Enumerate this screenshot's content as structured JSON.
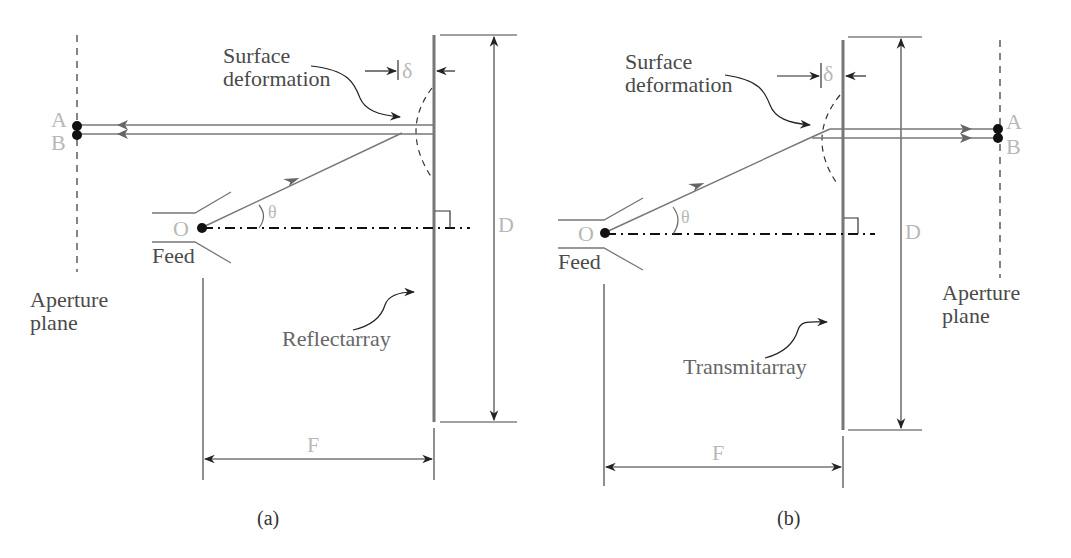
{
  "figure": {
    "colors": {
      "line": "#555555",
      "surface": "#777777",
      "light_label": "#b8b8b8",
      "dark_label": "#4a4a4a",
      "dot": "#111111"
    },
    "panels": [
      {
        "id": "a",
        "caption": "(a)",
        "array_label": "Reflectarray",
        "deformation_label": "Surface\ndeformation",
        "delta_label": "δ",
        "aperture_label": "Aperture\nplane",
        "feed_label": "Feed",
        "origin_label": "O",
        "angle_label": "θ",
        "point_a_label": "A",
        "point_b_label": "B",
        "diameter_label": "D",
        "focal_label": "F"
      },
      {
        "id": "b",
        "caption": "(b)",
        "array_label": "Transmitarray",
        "deformation_label": "Surface\ndeformation",
        "delta_label": "δ",
        "aperture_label": "Aperture\nplane",
        "feed_label": "Feed",
        "origin_label": "O",
        "angle_label": "θ",
        "point_a_label": "A",
        "point_b_label": "B",
        "diameter_label": "D",
        "focal_label": "F"
      }
    ]
  }
}
